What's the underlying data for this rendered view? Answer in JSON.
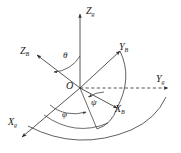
{
  "figure": {
    "kind": "3d-coordinate-frame-euler-angles",
    "background_color": "#ffffff",
    "line_color": "#2b2b2b",
    "origin_label": "O",
    "axes": [
      {
        "name": "Z-ground-axis",
        "symbol": "Z",
        "subscript": "g",
        "label": "Z_g",
        "direction": "up",
        "style": "solid"
      },
      {
        "name": "Y-ground-axis",
        "symbol": "Y",
        "subscript": "g",
        "label": "Y_g",
        "direction": "right",
        "style": "dashed"
      },
      {
        "name": "X-ground-axis",
        "symbol": "X",
        "subscript": "g",
        "label": "X_g",
        "direction": "lower-left",
        "style": "solid"
      },
      {
        "name": "Z-body-axis",
        "symbol": "Z",
        "subscript": "B",
        "label": "Z_B",
        "direction": "upper-left",
        "style": "solid"
      },
      {
        "name": "Y-body-axis",
        "symbol": "Y",
        "subscript": "B",
        "label": "Y_B",
        "direction": "upper-right",
        "style": "solid"
      },
      {
        "name": "X-body-axis",
        "symbol": "X",
        "subscript": "B",
        "label": "X_B",
        "direction": "lower-right",
        "style": "solid"
      }
    ],
    "angles": [
      {
        "name": "theta-angle",
        "symbol": "θ",
        "between": "Z_g and Z_B"
      },
      {
        "name": "psi-angle",
        "symbol": "ψ",
        "between": "Y_g and X_B"
      },
      {
        "name": "phi-angle",
        "symbol": "φ",
        "between": "X_g and projection"
      }
    ],
    "labels": {
      "z_ground": {
        "sym": "Z",
        "sub": "g"
      },
      "y_ground": {
        "sym": "Y",
        "sub": "g"
      },
      "x_ground": {
        "sym": "X",
        "sub": "g"
      },
      "z_body": {
        "sym": "Z",
        "sub": "B"
      },
      "y_body": {
        "sym": "Y",
        "sub": "B"
      },
      "x_body": {
        "sym": "X",
        "sub": "B"
      },
      "origin": "O",
      "theta": "θ",
      "psi": "ψ",
      "phi": "φ"
    }
  }
}
